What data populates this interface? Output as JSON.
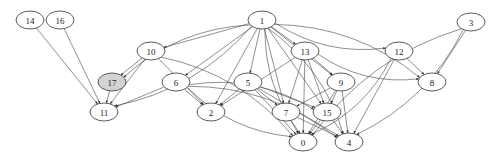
{
  "graph": {
    "type": "directed",
    "nodes": [
      {
        "id": "14",
        "label": "14",
        "x": 30,
        "y": 20,
        "highlight": false
      },
      {
        "id": "16",
        "label": "16",
        "x": 60,
        "y": 20,
        "highlight": false
      },
      {
        "id": "1",
        "label": "1",
        "x": 262,
        "y": 20,
        "highlight": false
      },
      {
        "id": "3",
        "label": "3",
        "x": 471,
        "y": 22,
        "highlight": false
      },
      {
        "id": "10",
        "label": "10",
        "x": 151,
        "y": 51,
        "highlight": false
      },
      {
        "id": "13",
        "label": "13",
        "x": 305,
        "y": 51,
        "highlight": false
      },
      {
        "id": "12",
        "label": "12",
        "x": 399,
        "y": 51,
        "highlight": false
      },
      {
        "id": "17",
        "label": "17",
        "x": 112,
        "y": 82,
        "highlight": true
      },
      {
        "id": "6",
        "label": "6",
        "x": 176,
        "y": 82,
        "highlight": false
      },
      {
        "id": "5",
        "label": "5",
        "x": 248,
        "y": 82,
        "highlight": false
      },
      {
        "id": "9",
        "label": "9",
        "x": 341,
        "y": 82,
        "highlight": false
      },
      {
        "id": "8",
        "label": "8",
        "x": 432,
        "y": 82,
        "highlight": false
      },
      {
        "id": "11",
        "label": "11",
        "x": 104,
        "y": 112,
        "highlight": false
      },
      {
        "id": "2",
        "label": "2",
        "x": 211,
        "y": 112,
        "highlight": false
      },
      {
        "id": "7",
        "label": "7",
        "x": 286,
        "y": 112,
        "highlight": false
      },
      {
        "id": "15",
        "label": "15",
        "x": 327,
        "y": 112,
        "highlight": false
      },
      {
        "id": "0",
        "label": "0",
        "x": 303,
        "y": 142,
        "highlight": false
      },
      {
        "id": "4",
        "label": "4",
        "x": 349,
        "y": 142,
        "highlight": false
      }
    ],
    "edges": [
      [
        "14",
        "11"
      ],
      [
        "16",
        "11"
      ],
      [
        "1",
        "10"
      ],
      [
        "1",
        "17"
      ],
      [
        "1",
        "11"
      ],
      [
        "1",
        "6"
      ],
      [
        "1",
        "2"
      ],
      [
        "1",
        "5"
      ],
      [
        "1",
        "7"
      ],
      [
        "1",
        "13"
      ],
      [
        "1",
        "9"
      ],
      [
        "1",
        "12"
      ],
      [
        "1",
        "8"
      ],
      [
        "1",
        "15"
      ],
      [
        "1",
        "4"
      ],
      [
        "1",
        "0"
      ],
      [
        "3",
        "8"
      ],
      [
        "3",
        "0"
      ],
      [
        "3",
        "4"
      ],
      [
        "10",
        "17"
      ],
      [
        "10",
        "11"
      ],
      [
        "10",
        "2"
      ],
      [
        "10",
        "0"
      ],
      [
        "17",
        "11"
      ],
      [
        "6",
        "11"
      ],
      [
        "6",
        "2"
      ],
      [
        "6",
        "15"
      ],
      [
        "6",
        "0"
      ],
      [
        "6",
        "4"
      ],
      [
        "13",
        "2"
      ],
      [
        "13",
        "7"
      ],
      [
        "13",
        "9"
      ],
      [
        "13",
        "15"
      ],
      [
        "13",
        "8"
      ],
      [
        "13",
        "0"
      ],
      [
        "12",
        "8"
      ],
      [
        "12",
        "0"
      ],
      [
        "12",
        "4"
      ],
      [
        "5",
        "2"
      ],
      [
        "5",
        "7"
      ],
      [
        "5",
        "15"
      ],
      [
        "5",
        "0"
      ],
      [
        "5",
        "4"
      ],
      [
        "9",
        "7"
      ],
      [
        "9",
        "15"
      ],
      [
        "9",
        "0"
      ],
      [
        "9",
        "4"
      ],
      [
        "7",
        "0"
      ],
      [
        "7",
        "4"
      ],
      [
        "15",
        "0"
      ],
      [
        "15",
        "4"
      ]
    ],
    "highlight_color": "#d3d3d3"
  }
}
